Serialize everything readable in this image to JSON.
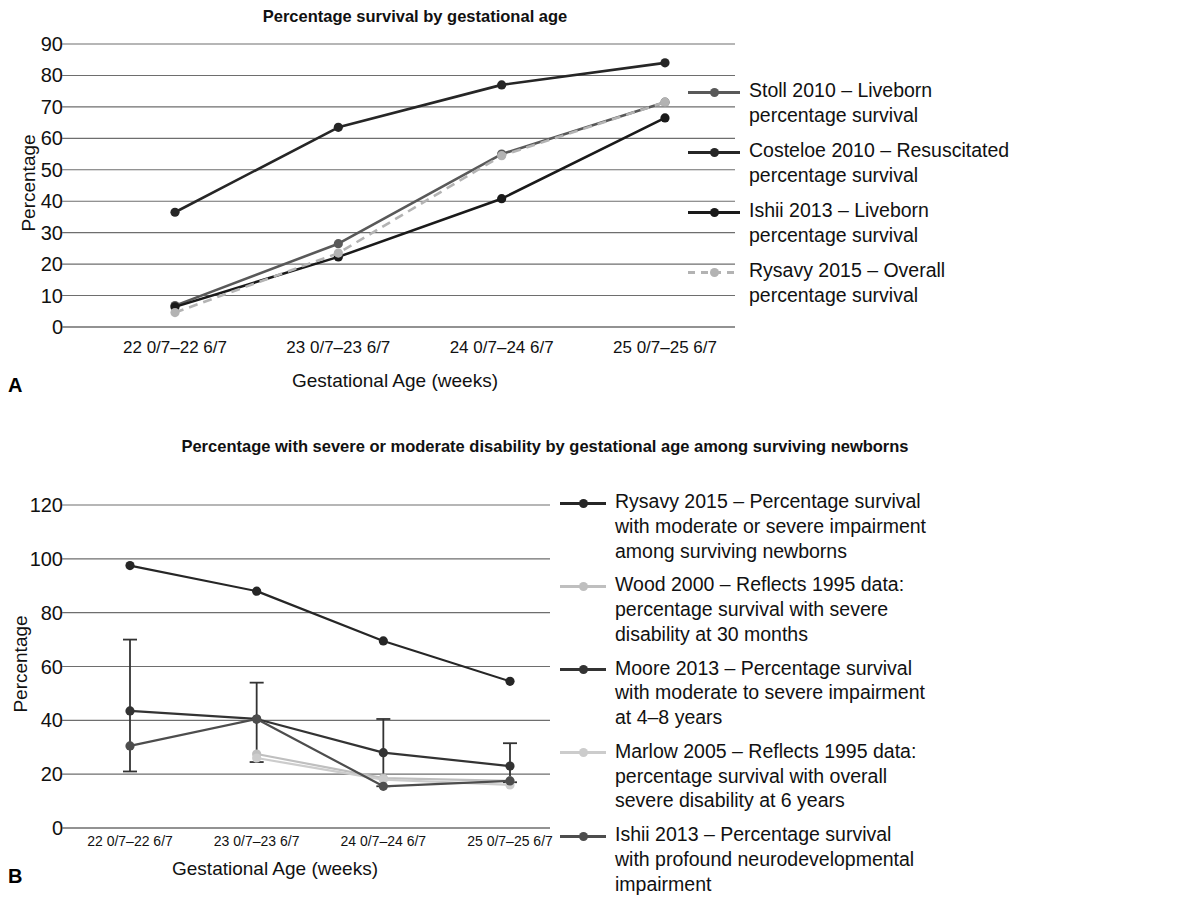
{
  "figure": {
    "panelA_letter": "A",
    "panelB_letter": "B"
  },
  "chart_data": [
    {
      "panel": "A",
      "type": "line",
      "title": "Percentage survival by gestational age",
      "xlabel": "Gestational Age (weeks)",
      "ylabel": "Percentage",
      "categories": [
        "22 0/7–22 6/7",
        "23 0/7–23 6/7",
        "24 0/7–24 6/7",
        "25 0/7–25 6/7"
      ],
      "ylim": [
        0,
        90
      ],
      "yticks": [
        0,
        10,
        20,
        30,
        40,
        50,
        60,
        70,
        80,
        90
      ],
      "grid": "horizontal",
      "legend_position": "right",
      "series": [
        {
          "name": "Stoll 2010 – Liveborn\npercentage survival",
          "short": "Stoll 2010",
          "color": "#595959",
          "style": "solid",
          "values": [
            6.8,
            26.5,
            55.0,
            71.5
          ]
        },
        {
          "name": "Costeloe 2010 – Resuscitated\npercentage survival",
          "short": "Costeloe 2010",
          "color": "#262626",
          "style": "solid",
          "values": [
            36.5,
            63.5,
            77.0,
            84.0
          ]
        },
        {
          "name": "Ishii 2013 – Liveborn\npercentage survival",
          "short": "Ishii 2013",
          "color": "#1a1a1a",
          "style": "solid",
          "values": [
            6.4,
            22.3,
            40.8,
            66.5
          ]
        },
        {
          "name": "Rysavy 2015 – Overall\npercentage survival",
          "short": "Rysavy 2015",
          "color": "#b3b3b3",
          "style": "dashed",
          "values": [
            4.6,
            23.5,
            54.5,
            71.5
          ]
        }
      ]
    },
    {
      "panel": "B",
      "type": "line",
      "title": "Percentage with severe or moderate disability by gestational age among\nsurviving newborns",
      "xlabel": "Gestational Age (weeks)",
      "ylabel": "Percentage",
      "categories": [
        "22 0/7–22 6/7",
        "23 0/7–23 6/7",
        "24 0/7–24 6/7",
        "25 0/7–25 6/7"
      ],
      "ylim": [
        0,
        120
      ],
      "yticks": [
        0,
        20,
        40,
        60,
        80,
        100,
        120
      ],
      "grid": "horizontal",
      "legend_position": "right",
      "series": [
        {
          "name": "Rysavy 2015 – Percentage survival\nwith moderate or severe impairment\namong surviving newborns",
          "short": "Rysavy 2015",
          "color": "#262626",
          "style": "solid",
          "values": [
            97.5,
            88.0,
            69.5,
            54.5
          ],
          "errors": [
            null,
            null,
            null,
            null
          ]
        },
        {
          "name": "Wood 2000 – Reflects 1995 data:\npercentage survival with severe\ndisability at 30 months",
          "short": "Wood 2000",
          "color": "#bfbfbf",
          "style": "solid",
          "values": [
            null,
            27.5,
            18.5,
            17.5
          ],
          "errors": [
            null,
            null,
            null,
            null
          ]
        },
        {
          "name": "Moore 2013 – Percentage survival\nwith moderate to severe impairment\nat 4–8 years",
          "short": "Moore 2013",
          "color": "#333333",
          "style": "solid",
          "values": [
            43.5,
            40.5,
            28.0,
            23.0
          ],
          "errors": [
            {
              "low": 21.0,
              "high": 70.0
            },
            {
              "low": 24.5,
              "high": 54.0
            },
            {
              "low": 15.5,
              "high": 40.5
            },
            {
              "low": 17.0,
              "high": 31.5
            }
          ]
        },
        {
          "name": "Marlow 2005 – Reflects 1995 data:\npercentage survival with overall\nsevere disability at 6 years",
          "short": "Marlow 2005",
          "color": "#cccccc",
          "style": "solid",
          "values": [
            null,
            26.0,
            18.0,
            16.0
          ],
          "errors": [
            null,
            null,
            null,
            null
          ]
        },
        {
          "name": "Ishii 2013 – Percentage survival\nwith profound neurodevelopmental\nimpairment",
          "short": "Ishii 2013",
          "color": "#4d4d4d",
          "style": "solid",
          "values": [
            30.5,
            40.5,
            15.5,
            17.5
          ],
          "errors": [
            null,
            null,
            null,
            null
          ]
        }
      ]
    }
  ]
}
